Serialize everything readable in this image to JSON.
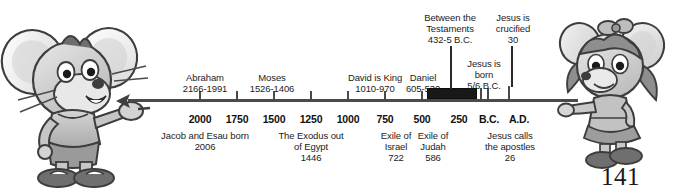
{
  "page": {
    "number": "141",
    "background": "#ffffff",
    "line_color": "#4a4a4a",
    "band_color": "#181818"
  },
  "characters": {
    "left": {
      "name": "boy-mouse-pointing-right",
      "description": "Cartoon grey mouse boy with large ears pointing right along the timeline"
    },
    "right": {
      "name": "girl-mouse-pointing-left",
      "description": "Cartoon grey mouse girl with pigtails and bow pointing left along the timeline"
    }
  },
  "timeline": {
    "era_markers": [
      {
        "label": "B.C.",
        "x": 481
      },
      {
        "label": "A.D.",
        "x": 511
      }
    ],
    "axis_ticks": [
      {
        "label": "2000",
        "x": 200
      },
      {
        "label": "1750",
        "x": 237
      },
      {
        "label": "1500",
        "x": 274
      },
      {
        "label": "1250",
        "x": 311
      },
      {
        "label": "1000",
        "x": 348
      },
      {
        "label": "750",
        "x": 385
      },
      {
        "label": "500",
        "x": 422
      },
      {
        "label": "250",
        "x": 459
      }
    ],
    "labels_above": [
      {
        "name": "abraham",
        "lines": [
          "Abraham",
          "2166-1991"
        ],
        "x": 205,
        "y": 72
      },
      {
        "name": "moses",
        "lines": [
          "Moses",
          "1526-1406"
        ],
        "x": 272,
        "y": 72
      },
      {
        "name": "david-is-king",
        "lines": [
          "David is King",
          "1010-970"
        ],
        "x": 375,
        "y": 72
      },
      {
        "name": "daniel",
        "lines": [
          "Daniel",
          "605-530"
        ],
        "x": 423,
        "y": 72
      },
      {
        "name": "between-the-testaments",
        "lines": [
          "Between the",
          "Testaments",
          "432-5 B.C."
        ],
        "x": 450,
        "y": 14
      },
      {
        "name": "jesus-is-born",
        "lines": [
          "Jesus is",
          "born",
          "5/6 B.C."
        ],
        "x": 484,
        "y": 60
      },
      {
        "name": "jesus-is-crucified",
        "lines": [
          "Jesus is",
          "crucified",
          "30"
        ],
        "x": 513,
        "y": 14
      }
    ],
    "labels_below": [
      {
        "name": "jacob-and-esau-born",
        "lines": [
          "Jacob and Esau born",
          "2006"
        ],
        "x": 205,
        "y": 130
      },
      {
        "name": "the-exodus-out-of-egypt",
        "lines": [
          "The Exodus out",
          "of Egypt",
          "1446"
        ],
        "x": 311,
        "y": 130
      },
      {
        "name": "exile-of-israel",
        "lines": [
          "Exile of",
          "Israel",
          "722"
        ],
        "x": 396,
        "y": 130
      },
      {
        "name": "exile-of-judah",
        "lines": [
          "Exile of",
          "Judah",
          "586"
        ],
        "x": 433,
        "y": 130
      },
      {
        "name": "jesus-calls-the-apostles",
        "lines": [
          "Jesus calls",
          "the apostles",
          "26"
        ],
        "x": 510,
        "y": 130
      }
    ]
  }
}
